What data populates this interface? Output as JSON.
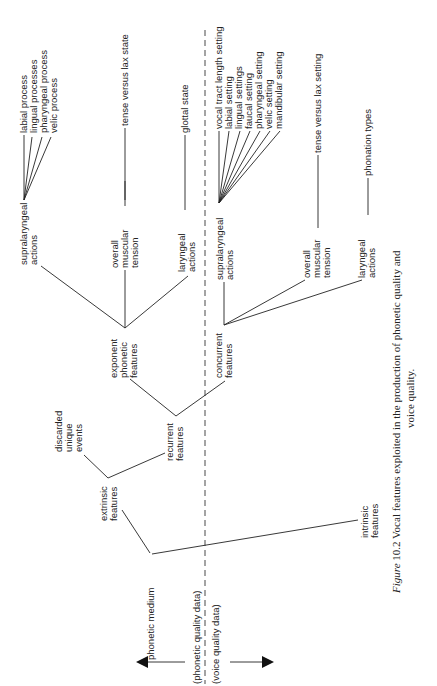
{
  "figure": {
    "caption_label": "Figure",
    "caption_number": "10.2",
    "caption_line1": "Vocal features exploited in the production of phonetic quality and",
    "caption_line2": "voice quality."
  },
  "divider": {
    "upper_label": "(phonetic quality data)",
    "lower_label": "(voice quality data)",
    "arrow_left": "arrow-left-icon",
    "arrow_right": "arrow-right-icon"
  },
  "tree": {
    "root": "phonetic medium",
    "extrinsic": [
      "extrinsic",
      "features"
    ],
    "intrinsic": [
      "intrinsic",
      "features"
    ],
    "discarded": [
      "discarded",
      "unique",
      "events"
    ],
    "recurrent": [
      "recurrent",
      "features"
    ],
    "exponent": [
      "exponent",
      "phonetic",
      "features"
    ],
    "concurrent": [
      "concurrent",
      "features"
    ],
    "phonetic_side": {
      "supralaryngeal": [
        "supralaryngeal",
        "actions"
      ],
      "muscular": [
        "overall",
        "muscular",
        "tension"
      ],
      "laryngeal": [
        "laryngeal",
        "actions"
      ],
      "supralaryngeal_leaves": [
        "labial process",
        "lingual processes",
        "pharyngeal process",
        "velic process"
      ],
      "muscular_leaf": "tense versus lax state",
      "laryngeal_leaf": "glottal state"
    },
    "voice_side": {
      "supralaryngeal": [
        "supralaryngeal",
        "actions"
      ],
      "muscular": [
        "overall",
        "muscular",
        "tension"
      ],
      "laryngeal": [
        "laryngeal",
        "actions"
      ],
      "supralaryngeal_leaves": [
        "vocal tract length setting",
        "labial setting",
        "lingual settings",
        "faucal setting",
        "pharyngeal setting",
        "velic setting",
        "mandibular setting"
      ],
      "muscular_leaf": "tense versus lax setting",
      "laryngeal_leaf": "phonation types"
    }
  }
}
